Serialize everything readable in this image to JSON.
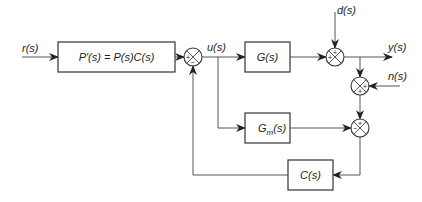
{
  "diagram": {
    "type": "block-diagram",
    "signals": {
      "r": "r(s)",
      "u": "u(s)",
      "d": "d(s)",
      "y": "y(s)",
      "n": "n(s)"
    },
    "blocks": {
      "pprime": {
        "label": "P'(s) = P(s)C(s)"
      },
      "g": {
        "label": "G(s)"
      },
      "gm": {
        "label_main": "G",
        "label_sub": "m",
        "label_tail": "(s)"
      },
      "c": {
        "label": "C(s)"
      }
    },
    "junctions": {
      "sum1": {
        "signs": [
          "+",
          "−"
        ]
      },
      "sum2": {
        "signs": [
          "+",
          "+"
        ]
      },
      "sum3": {
        "signs": [
          "+",
          "+"
        ]
      },
      "sum4": {
        "signs": [
          "+",
          "−"
        ]
      }
    },
    "colors": {
      "line": "#555555",
      "block_border": "#333333",
      "text": "#222222",
      "background": "#ffffff"
    }
  }
}
